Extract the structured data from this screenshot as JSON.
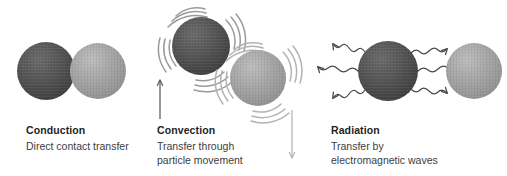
{
  "diagram": {
    "title_semantic": "heat-transfer-modes",
    "background": "#ffffff",
    "colors": {
      "sphere_dark": "#4f4f4f",
      "sphere_dark_edge": "#3a3a3a",
      "sphere_light": "#a3a3a3",
      "sphere_light_edge": "#8e8e8e",
      "arrow_dark": "#555555",
      "arrow_light": "#b0b0b0",
      "motion_arc": "#9a9a9a",
      "wave": "#4a4a4a",
      "heading_text": "#1f1f1f",
      "body_text": "#3d3d3d"
    }
  },
  "panels": [
    {
      "id": "conduction",
      "title": "Conduction",
      "description": "Direct contact transfer",
      "icon": "two-touching-spheres-icon",
      "spheres": [
        {
          "name": "hot-sphere",
          "cx": 46,
          "cy": 71,
          "r": 29,
          "shade": "dark"
        },
        {
          "name": "cold-sphere",
          "cx": 98,
          "cy": 71,
          "r": 28,
          "shade": "light"
        }
      ]
    },
    {
      "id": "convection",
      "title": "Convection",
      "description": "Transfer through\nparticle movement",
      "icon": "moving-spheres-with-motion-lines-icon",
      "spheres": [
        {
          "name": "rising-hot-sphere",
          "cx": 201,
          "cy": 46,
          "r": 29,
          "shade": "dark"
        },
        {
          "name": "sinking-cold-sphere",
          "cx": 258,
          "cy": 78,
          "r": 28,
          "shade": "light"
        }
      ],
      "arrows": [
        {
          "name": "up-arrow",
          "direction": "up",
          "x": 160,
          "y1": 117,
          "y2": 79,
          "tone": "dark"
        },
        {
          "name": "down-arrow",
          "direction": "down",
          "x": 292,
          "y1": 110,
          "y2": 158,
          "tone": "light"
        }
      ]
    },
    {
      "id": "radiation",
      "title": "Radiation",
      "description": "Transfer by\nelectromagnetic waves",
      "icon": "sphere-emitting-wavy-rays-icon",
      "spheres": [
        {
          "name": "emitting-sphere",
          "cx": 388,
          "cy": 71,
          "r": 30,
          "shade": "dark"
        },
        {
          "name": "receiving-sphere",
          "cx": 474,
          "cy": 71,
          "r": 28,
          "shade": "light"
        }
      ],
      "waves": {
        "left_count": 3,
        "right_count": 3,
        "style": "squiggly-arrow"
      }
    }
  ]
}
